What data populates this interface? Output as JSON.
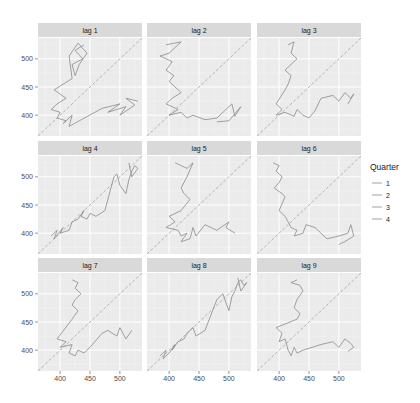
{
  "chart_data": {
    "type": "line",
    "title": "",
    "xlabel": "",
    "ylabel": "",
    "facet_labels": [
      "lag 1",
      "lag 2",
      "lag 3",
      "lag 4",
      "lag 5",
      "lag 6",
      "lag 7",
      "lag 8",
      "lag 9"
    ],
    "xlim": [
      363,
      537
    ],
    "ylim": [
      363,
      537
    ],
    "x_ticks": [
      400,
      450,
      500
    ],
    "y_ticks": [
      400,
      450,
      500
    ],
    "grid": true,
    "reference_line": "y = x (dashed)",
    "legend": {
      "title": "Quarter",
      "entries": [
        "1",
        "2",
        "3",
        "4"
      ],
      "position": "right"
    },
    "series_color": "#8a8a8a",
    "panels": [
      {
        "label": "lag 1",
        "points": [
          [
            440,
            525
          ],
          [
            425,
            515
          ],
          [
            438,
            500
          ],
          [
            420,
            490
          ],
          [
            425,
            470
          ],
          [
            432,
            490
          ],
          [
            445,
            510
          ],
          [
            430,
            528
          ],
          [
            415,
            505
          ],
          [
            420,
            465
          ],
          [
            390,
            445
          ],
          [
            410,
            430
          ],
          [
            395,
            420
          ],
          [
            385,
            410
          ],
          [
            400,
            405
          ],
          [
            395,
            395
          ],
          [
            410,
            390
          ],
          [
            405,
            385
          ],
          [
            420,
            400
          ],
          [
            415,
            380
          ],
          [
            470,
            412
          ],
          [
            500,
            420
          ],
          [
            480,
            405
          ],
          [
            510,
            415
          ],
          [
            500,
            400
          ],
          [
            525,
            418
          ],
          [
            510,
            430
          ],
          [
            530,
            425
          ]
        ]
      },
      {
        "label": "lag 2",
        "points": [
          [
            395,
            525
          ],
          [
            420,
            530
          ],
          [
            400,
            510
          ],
          [
            385,
            505
          ],
          [
            405,
            495
          ],
          [
            395,
            480
          ],
          [
            408,
            470
          ],
          [
            400,
            460
          ],
          [
            420,
            440
          ],
          [
            405,
            430
          ],
          [
            395,
            420
          ],
          [
            415,
            410
          ],
          [
            400,
            400
          ],
          [
            420,
            405
          ],
          [
            430,
            395
          ],
          [
            440,
            400
          ],
          [
            460,
            392
          ],
          [
            480,
            395
          ],
          [
            495,
            410
          ],
          [
            505,
            420
          ],
          [
            510,
            398
          ],
          [
            520,
            415
          ],
          [
            500,
            390
          ],
          [
            480,
            388
          ]
        ]
      },
      {
        "label": "lag 3",
        "points": [
          [
            415,
            525
          ],
          [
            425,
            530
          ],
          [
            420,
            510
          ],
          [
            430,
            500
          ],
          [
            410,
            480
          ],
          [
            420,
            470
          ],
          [
            415,
            455
          ],
          [
            410,
            445
          ],
          [
            395,
            420
          ],
          [
            405,
            410
          ],
          [
            395,
            400
          ],
          [
            410,
            405
          ],
          [
            425,
            398
          ],
          [
            430,
            410
          ],
          [
            440,
            400
          ],
          [
            450,
            395
          ],
          [
            460,
            408
          ],
          [
            470,
            430
          ],
          [
            490,
            435
          ],
          [
            500,
            425
          ],
          [
            510,
            440
          ],
          [
            520,
            430
          ],
          [
            525,
            438
          ],
          [
            515,
            420
          ]
        ]
      },
      {
        "label": "lag 4",
        "points": [
          [
            385,
            395
          ],
          [
            395,
            405
          ],
          [
            390,
            390
          ],
          [
            405,
            410
          ],
          [
            400,
            400
          ],
          [
            415,
            405
          ],
          [
            420,
            420
          ],
          [
            430,
            425
          ],
          [
            440,
            440
          ],
          [
            435,
            430
          ],
          [
            445,
            425
          ],
          [
            450,
            435
          ],
          [
            460,
            430
          ],
          [
            475,
            440
          ],
          [
            490,
            500
          ],
          [
            495,
            505
          ],
          [
            500,
            485
          ],
          [
            510,
            470
          ],
          [
            515,
            495
          ],
          [
            520,
            510
          ],
          [
            525,
            520
          ],
          [
            530,
            515
          ],
          [
            520,
            500
          ],
          [
            515,
            525
          ]
        ]
      },
      {
        "label": "lag 5",
        "points": [
          [
            410,
            525
          ],
          [
            420,
            520
          ],
          [
            430,
            515
          ],
          [
            440,
            525
          ],
          [
            430,
            500
          ],
          [
            420,
            480
          ],
          [
            425,
            470
          ],
          [
            435,
            460
          ],
          [
            420,
            440
          ],
          [
            400,
            430
          ],
          [
            410,
            420
          ],
          [
            395,
            410
          ],
          [
            415,
            405
          ],
          [
            420,
            395
          ],
          [
            430,
            400
          ],
          [
            420,
            385
          ],
          [
            435,
            390
          ],
          [
            440,
            410
          ],
          [
            445,
            395
          ],
          [
            460,
            415
          ],
          [
            480,
            405
          ],
          [
            500,
            420
          ],
          [
            495,
            410
          ],
          [
            510,
            400
          ]
        ]
      },
      {
        "label": "lag 6",
        "points": [
          [
            390,
            525
          ],
          [
            400,
            520
          ],
          [
            395,
            510
          ],
          [
            405,
            500
          ],
          [
            400,
            490
          ],
          [
            392,
            480
          ],
          [
            405,
            470
          ],
          [
            410,
            465
          ],
          [
            400,
            440
          ],
          [
            410,
            430
          ],
          [
            415,
            420
          ],
          [
            420,
            410
          ],
          [
            430,
            405
          ],
          [
            425,
            395
          ],
          [
            440,
            400
          ],
          [
            445,
            415
          ],
          [
            460,
            410
          ],
          [
            480,
            390
          ],
          [
            500,
            395
          ],
          [
            515,
            400
          ],
          [
            520,
            415
          ],
          [
            525,
            395
          ],
          [
            510,
            385
          ],
          [
            500,
            380
          ]
        ]
      },
      {
        "label": "lag 7",
        "points": [
          [
            420,
            525
          ],
          [
            430,
            520
          ],
          [
            425,
            510
          ],
          [
            435,
            500
          ],
          [
            425,
            490
          ],
          [
            420,
            480
          ],
          [
            430,
            470
          ],
          [
            420,
            455
          ],
          [
            395,
            420
          ],
          [
            410,
            415
          ],
          [
            400,
            405
          ],
          [
            420,
            410
          ],
          [
            415,
            395
          ],
          [
            425,
            390
          ],
          [
            430,
            400
          ],
          [
            440,
            395
          ],
          [
            450,
            405
          ],
          [
            470,
            430
          ],
          [
            480,
            435
          ],
          [
            495,
            425
          ],
          [
            500,
            440
          ],
          [
            505,
            430
          ],
          [
            510,
            420
          ],
          [
            520,
            435
          ]
        ]
      },
      {
        "label": "lag 8",
        "points": [
          [
            385,
            390
          ],
          [
            395,
            400
          ],
          [
            390,
            385
          ],
          [
            400,
            395
          ],
          [
            410,
            410
          ],
          [
            405,
            400
          ],
          [
            415,
            415
          ],
          [
            425,
            420
          ],
          [
            430,
            430
          ],
          [
            440,
            440
          ],
          [
            445,
            425
          ],
          [
            460,
            435
          ],
          [
            480,
            490
          ],
          [
            490,
            500
          ],
          [
            495,
            485
          ],
          [
            500,
            470
          ],
          [
            505,
            495
          ],
          [
            510,
            505
          ],
          [
            515,
            520
          ],
          [
            520,
            525
          ],
          [
            525,
            515
          ],
          [
            530,
            520
          ],
          [
            520,
            505
          ],
          [
            515,
            528
          ]
        ]
      },
      {
        "label": "lag 9",
        "points": [
          [
            430,
            525
          ],
          [
            420,
            520
          ],
          [
            435,
            515
          ],
          [
            440,
            505
          ],
          [
            430,
            490
          ],
          [
            425,
            475
          ],
          [
            435,
            465
          ],
          [
            430,
            455
          ],
          [
            395,
            440
          ],
          [
            405,
            430
          ],
          [
            400,
            415
          ],
          [
            410,
            420
          ],
          [
            415,
            400
          ],
          [
            420,
            390
          ],
          [
            425,
            405
          ],
          [
            430,
            395
          ],
          [
            440,
            400
          ],
          [
            470,
            410
          ],
          [
            490,
            415
          ],
          [
            500,
            405
          ],
          [
            510,
            420
          ],
          [
            520,
            412
          ],
          [
            525,
            405
          ],
          [
            515,
            398
          ]
        ]
      }
    ]
  }
}
